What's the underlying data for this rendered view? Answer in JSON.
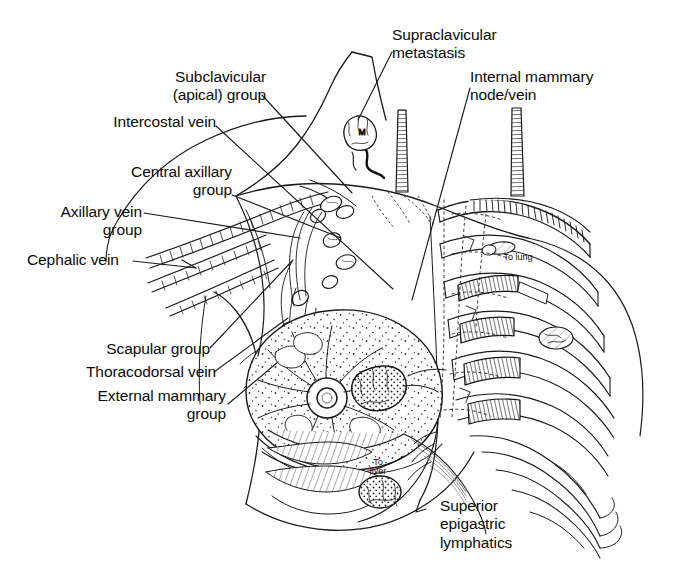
{
  "figure": {
    "background_color": "#ffffff",
    "ink_color": "#1a1a1a",
    "width": 673,
    "height": 580
  },
  "labels": {
    "subclavicular": "Subclavicular\n(apical) group",
    "intercostal_vein": "Intercostal vein",
    "central_axillary": "Central axillary\ngroup",
    "axillary_vein": "Axillary vein\ngroup",
    "cephalic_vein": "Cephalic vein",
    "scapular": "Scapular group",
    "thoracodorsal_vein": "Thoracodorsal vein",
    "external_mammary": "External mammary\ngroup",
    "supraclavicular": "Supraclavicular\nmetastasis",
    "internal_mammary": "Internal mammary\nnode/vein",
    "superior_epigastric": "Superior\nepigastric\nlymphatics"
  },
  "annotations": {
    "to_lung": "To lung",
    "to_liver": "To\nliver",
    "metastasis_marker": "M"
  }
}
